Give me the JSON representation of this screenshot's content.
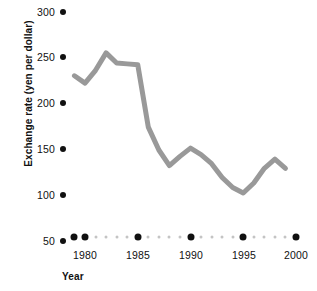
{
  "chart_data": {
    "type": "line",
    "title": "",
    "xlabel": "Year",
    "ylabel": "Exchange rate (yen per dollar)",
    "xlim": [
      1979,
      2000
    ],
    "ylim": [
      50,
      300
    ],
    "grid": false,
    "legend": "none",
    "line_color": "#999999",
    "line_width": 5,
    "x_tick_labels": [
      "1980",
      "1985",
      "1990",
      "1995",
      "2000"
    ],
    "x_ticks": [
      1980,
      1985,
      1990,
      1995,
      2000
    ],
    "y_tick_labels": [
      "300",
      "250",
      "200",
      "150",
      "100",
      "50"
    ],
    "y_ticks": [
      300,
      250,
      200,
      150,
      100,
      50
    ],
    "series": [
      {
        "name": "Exchange rate",
        "x": [
          1979,
          1980,
          1981,
          1982,
          1983,
          1984,
          1985,
          1986,
          1987,
          1988,
          1989,
          1990,
          1991,
          1992,
          1993,
          1994,
          1995,
          1996,
          1997,
          1998,
          1999
        ],
        "values": [
          226,
          218,
          232,
          251,
          240,
          239,
          238,
          170,
          145,
          128,
          138,
          147,
          140,
          130,
          115,
          104,
          98,
          109,
          125,
          135,
          125
        ]
      }
    ]
  },
  "axis": {
    "y_title": "Exchange rate (yen per dollar)",
    "x_title": "Year"
  }
}
